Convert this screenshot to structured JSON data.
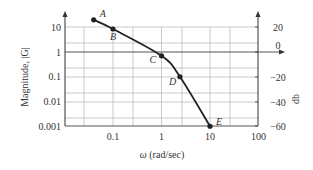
{
  "chart_data": {
    "type": "line",
    "title": "",
    "xlabel": "ω (rad/sec)",
    "ylabel": "Magnitude, |G|",
    "y2label": "db",
    "xscale": "log",
    "yscale": "log",
    "xlim": [
      0.01,
      100
    ],
    "ylim": [
      0.001,
      10
    ],
    "x_ticks": [
      "0.1",
      "1",
      "10",
      "100"
    ],
    "y_ticks": [
      "10",
      "1",
      "0.1",
      "0.01",
      "0.001"
    ],
    "y2_ticks": [
      "20",
      "0",
      "−20",
      "−40",
      "−60"
    ],
    "grid": true,
    "legend": null,
    "series": [
      {
        "name": "|G|",
        "points": [
          {
            "label": "A",
            "x": 0.04,
            "y": 20
          },
          {
            "label": "B",
            "x": 0.1,
            "y": 8.5
          },
          {
            "label": "C",
            "x": 1,
            "y": 0.7
          },
          {
            "label": "D",
            "x": 2.4,
            "y": 0.1
          },
          {
            "label": "E",
            "x": 10,
            "y": 0.001
          }
        ]
      }
    ]
  },
  "labels": {
    "xlabel_omega": "ω",
    "xlabel_units": "(rad/sec)",
    "ylabel": "Magnitude, |G|",
    "y2label": "db"
  }
}
